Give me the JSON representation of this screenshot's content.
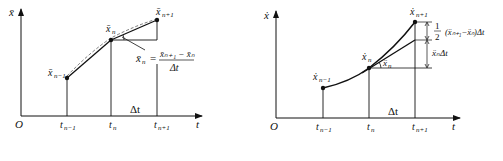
{
  "left_diagram": {
    "y_axis_label": "x̄",
    "x_axis_label": "t",
    "origin_label": "O",
    "points": [
      {
        "label": "x̄",
        "sub": "n−1"
      },
      {
        "label": "x̄",
        "sub": "n"
      },
      {
        "label": "x̄",
        "sub": "n+1"
      }
    ],
    "ticks": [
      {
        "label": "t",
        "sub": "n−1"
      },
      {
        "label": "t",
        "sub": "n"
      },
      {
        "label": "t",
        "sub": "n+1"
      }
    ],
    "delta_label": "Δt",
    "formula": {
      "lhs": "x̄",
      "lhs_sub": "n",
      "equals": "=",
      "numerator": "x̄ₙ₊₁ − x̄ₙ",
      "denominator": "Δt"
    }
  },
  "right_diagram": {
    "y_axis_label": "ẋ",
    "x_axis_label": "t",
    "origin_label": "O",
    "points": [
      {
        "label": "ẋ",
        "sub": "n−1"
      },
      {
        "label": "ẋ",
        "sub": "n"
      },
      {
        "label": "ẋ",
        "sub": "n+1"
      }
    ],
    "ticks": [
      {
        "label": "t",
        "sub": "n−1"
      },
      {
        "label": "t",
        "sub": "n"
      },
      {
        "label": "t",
        "sub": "n+1"
      }
    ],
    "delta_label": "Δt",
    "angle_label": "ẍ",
    "angle_sub": "n",
    "upper_annotation": {
      "frac_num": "1",
      "frac_den": "2",
      "expr": "(ẍₙ₊₁−ẍₙ)Δt"
    },
    "lower_annotation": "ẍₙΔt"
  }
}
